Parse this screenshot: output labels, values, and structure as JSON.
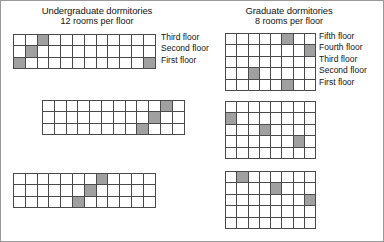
{
  "figure": {
    "background_color": "#ffffff",
    "border_color": "#9a9a9a",
    "grid_line_color": "#4a4a4a",
    "filled_cell_color": "#a0a0a0",
    "empty_cell_color": "#ffffff"
  },
  "panels": [
    {
      "id": "undergraduate",
      "title": "Undergraduate dormitories",
      "subtitle": "12 rooms per floor",
      "columns": 12,
      "rows": 3,
      "floor_labels": [
        "Third floor",
        "Second floor",
        "First floor"
      ],
      "buildings": [
        {
          "name": "undergraduate-building-1",
          "filled_cells": [
            {
              "row": 1,
              "col": 3
            },
            {
              "row": 2,
              "col": 2
            },
            {
              "row": 3,
              "col": 1
            },
            {
              "row": 3,
              "col": 12
            }
          ]
        },
        {
          "name": "undergraduate-building-2",
          "filled_cells": [
            {
              "row": 1,
              "col": 11
            },
            {
              "row": 2,
              "col": 10
            },
            {
              "row": 3,
              "col": 9
            }
          ]
        },
        {
          "name": "undergraduate-building-3",
          "filled_cells": [
            {
              "row": 1,
              "col": 8
            },
            {
              "row": 2,
              "col": 7
            },
            {
              "row": 3,
              "col": 6
            }
          ]
        }
      ]
    },
    {
      "id": "graduate",
      "title": "Graduate dormitories",
      "subtitle": "8 rooms per floor",
      "columns": 8,
      "rows": 5,
      "floor_labels": [
        "Fifth floor",
        "Fourth floor",
        "Third floor",
        "Second floor",
        "First floor"
      ],
      "buildings": [
        {
          "name": "graduate-building-1",
          "filled_cells": [
            {
              "row": 1,
              "col": 6
            },
            {
              "row": 2,
              "col": 8
            },
            {
              "row": 4,
              "col": 3
            },
            {
              "row": 5,
              "col": 6
            }
          ]
        },
        {
          "name": "graduate-building-2",
          "filled_cells": [
            {
              "row": 2,
              "col": 1
            },
            {
              "row": 3,
              "col": 4
            },
            {
              "row": 4,
              "col": 7
            }
          ]
        },
        {
          "name": "graduate-building-3",
          "filled_cells": [
            {
              "row": 1,
              "col": 2
            },
            {
              "row": 2,
              "col": 5
            },
            {
              "row": 3,
              "col": 8
            }
          ]
        }
      ]
    }
  ]
}
